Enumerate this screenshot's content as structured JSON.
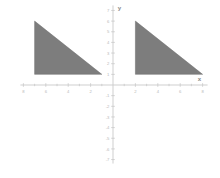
{
  "figure": {
    "title": "",
    "axis_labels": {
      "x": "x",
      "y": "y"
    },
    "axis_color": "#c9c9c9",
    "tick_label_color": "#b8b8b8",
    "shape_fill": "#7d7d7d",
    "background": "#ffffff"
  },
  "chart_data": {
    "type": "scatter",
    "title": "",
    "xlabel": "x",
    "ylabel": "y",
    "xlim": [
      -8,
      8
    ],
    "ylim": [
      -7,
      7
    ],
    "grid": false,
    "x_ticks": [
      -8,
      -6,
      -4,
      -2,
      2,
      4,
      6,
      8
    ],
    "x_tick_labels": [
      "8",
      "6",
      "4",
      "2",
      "2",
      "4",
      "6",
      "8"
    ],
    "x_minor_ticks": [
      -7,
      -5,
      -3,
      -1,
      1,
      3,
      5,
      7
    ],
    "y_ticks": [
      7,
      6,
      5,
      4,
      3,
      2,
      1,
      -1,
      -2,
      -3,
      -4,
      -5,
      -6,
      -7
    ],
    "y_tick_labels": [
      "7",
      "6",
      "5",
      "4",
      "3",
      "2",
      "1",
      "-1",
      "-2",
      "-3",
      "-4",
      "-5",
      "-6",
      "-7"
    ],
    "shapes": [
      {
        "name": "left-triangle",
        "type": "polygon",
        "fill": "#7d7d7d",
        "vertices": [
          [
            -7,
            6
          ],
          [
            -7,
            1
          ],
          [
            -1,
            1
          ]
        ]
      },
      {
        "name": "right-triangle",
        "type": "polygon",
        "fill": "#7d7d7d",
        "vertices": [
          [
            2,
            6
          ],
          [
            2,
            1
          ],
          [
            8,
            1
          ]
        ]
      }
    ],
    "annotations": []
  }
}
